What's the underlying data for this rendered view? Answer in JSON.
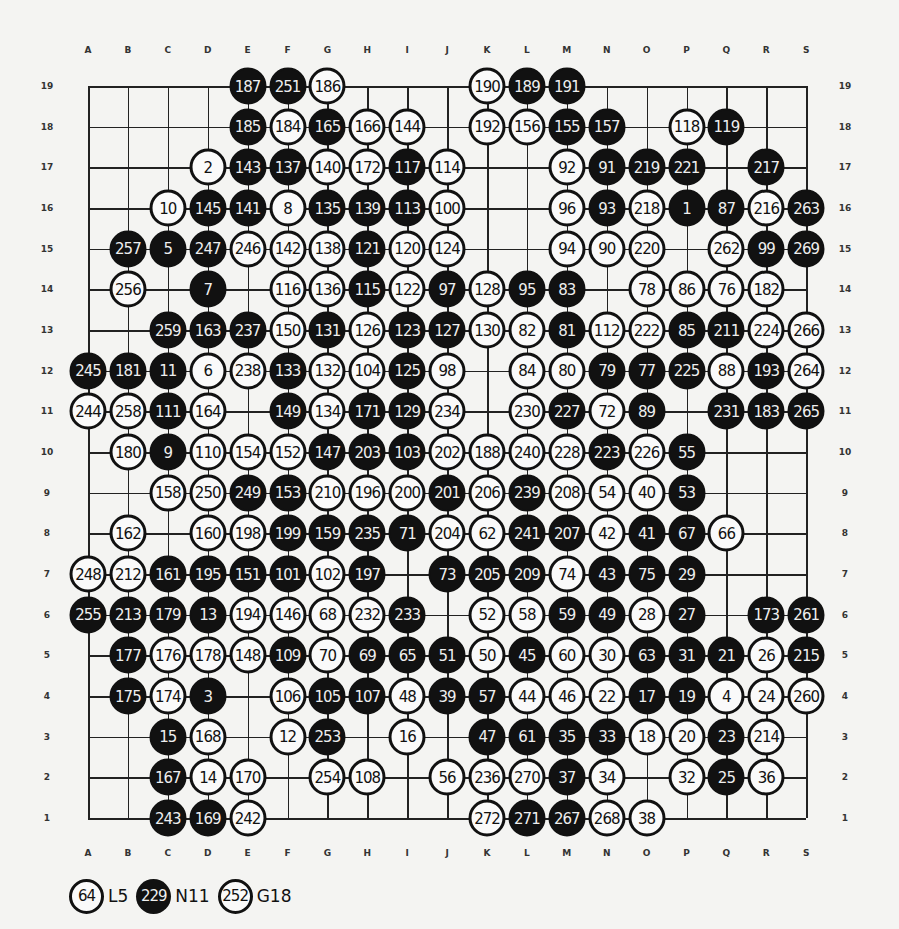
{
  "board": {
    "columns": [
      "A",
      "B",
      "C",
      "D",
      "E",
      "F",
      "G",
      "H",
      "I",
      "J",
      "K",
      "L",
      "M",
      "N",
      "O",
      "P",
      "Q",
      "R",
      "S"
    ],
    "rows": [
      19,
      18,
      17,
      16,
      15,
      14,
      13,
      12,
      11,
      10,
      9,
      8,
      7,
      6,
      5,
      4,
      3,
      2,
      1
    ],
    "colors": {
      "black": "#111111",
      "white": "#fafafa",
      "line": "#222222",
      "background": "#f4f4f2"
    }
  },
  "stones": [
    [
      "E",
      19,
      "187",
      "b"
    ],
    [
      "F",
      19,
      "251",
      "b"
    ],
    [
      "G",
      19,
      "186",
      "w"
    ],
    [
      "K",
      19,
      "190",
      "w"
    ],
    [
      "L",
      19,
      "189",
      "b"
    ],
    [
      "M",
      19,
      "191",
      "b"
    ],
    [
      "E",
      18,
      "185",
      "b"
    ],
    [
      "F",
      18,
      "184",
      "w"
    ],
    [
      "G",
      18,
      "165",
      "b"
    ],
    [
      "H",
      18,
      "166",
      "w"
    ],
    [
      "I",
      18,
      "144",
      "w"
    ],
    [
      "K",
      18,
      "192",
      "w"
    ],
    [
      "L",
      18,
      "156",
      "w"
    ],
    [
      "M",
      18,
      "155",
      "b"
    ],
    [
      "N",
      18,
      "157",
      "b"
    ],
    [
      "P",
      18,
      "118",
      "w"
    ],
    [
      "Q",
      18,
      "119",
      "b"
    ],
    [
      "D",
      17,
      "2",
      "w"
    ],
    [
      "E",
      17,
      "143",
      "b"
    ],
    [
      "F",
      17,
      "137",
      "b"
    ],
    [
      "G",
      17,
      "140",
      "w"
    ],
    [
      "H",
      17,
      "172",
      "w"
    ],
    [
      "I",
      17,
      "117",
      "b"
    ],
    [
      "J",
      17,
      "114",
      "w"
    ],
    [
      "M",
      17,
      "92",
      "w"
    ],
    [
      "N",
      17,
      "91",
      "b"
    ],
    [
      "O",
      17,
      "219",
      "b"
    ],
    [
      "P",
      17,
      "221",
      "b"
    ],
    [
      "R",
      17,
      "217",
      "b"
    ],
    [
      "C",
      16,
      "10",
      "w"
    ],
    [
      "D",
      16,
      "145",
      "b"
    ],
    [
      "E",
      16,
      "141",
      "b"
    ],
    [
      "F",
      16,
      "8",
      "w"
    ],
    [
      "G",
      16,
      "135",
      "b"
    ],
    [
      "H",
      16,
      "139",
      "b"
    ],
    [
      "I",
      16,
      "113",
      "b"
    ],
    [
      "J",
      16,
      "100",
      "w"
    ],
    [
      "M",
      16,
      "96",
      "w"
    ],
    [
      "N",
      16,
      "93",
      "b"
    ],
    [
      "O",
      16,
      "218",
      "w"
    ],
    [
      "P",
      16,
      "1",
      "b"
    ],
    [
      "Q",
      16,
      "87",
      "b"
    ],
    [
      "R",
      16,
      "216",
      "w"
    ],
    [
      "S",
      16,
      "263",
      "b"
    ],
    [
      "B",
      15,
      "257",
      "b"
    ],
    [
      "C",
      15,
      "5",
      "b"
    ],
    [
      "D",
      15,
      "247",
      "b"
    ],
    [
      "E",
      15,
      "246",
      "w"
    ],
    [
      "F",
      15,
      "142",
      "w"
    ],
    [
      "G",
      15,
      "138",
      "w"
    ],
    [
      "H",
      15,
      "121",
      "b"
    ],
    [
      "I",
      15,
      "120",
      "w"
    ],
    [
      "J",
      15,
      "124",
      "w"
    ],
    [
      "M",
      15,
      "94",
      "w"
    ],
    [
      "N",
      15,
      "90",
      "w"
    ],
    [
      "O",
      15,
      "220",
      "w"
    ],
    [
      "Q",
      15,
      "262",
      "w"
    ],
    [
      "R",
      15,
      "99",
      "b"
    ],
    [
      "S",
      15,
      "269",
      "b"
    ],
    [
      "B",
      14,
      "256",
      "w"
    ],
    [
      "D",
      14,
      "7",
      "b"
    ],
    [
      "F",
      14,
      "116",
      "w"
    ],
    [
      "G",
      14,
      "136",
      "w"
    ],
    [
      "H",
      14,
      "115",
      "b"
    ],
    [
      "I",
      14,
      "122",
      "w"
    ],
    [
      "J",
      14,
      "97",
      "b"
    ],
    [
      "K",
      14,
      "128",
      "w"
    ],
    [
      "L",
      14,
      "95",
      "b"
    ],
    [
      "M",
      14,
      "83",
      "b"
    ],
    [
      "O",
      14,
      "78",
      "w"
    ],
    [
      "P",
      14,
      "86",
      "w"
    ],
    [
      "Q",
      14,
      "76",
      "w"
    ],
    [
      "R",
      14,
      "182",
      "w"
    ],
    [
      "C",
      13,
      "259",
      "b"
    ],
    [
      "D",
      13,
      "163",
      "b"
    ],
    [
      "E",
      13,
      "237",
      "b"
    ],
    [
      "F",
      13,
      "150",
      "w"
    ],
    [
      "G",
      13,
      "131",
      "b"
    ],
    [
      "H",
      13,
      "126",
      "w"
    ],
    [
      "I",
      13,
      "123",
      "b"
    ],
    [
      "J",
      13,
      "127",
      "b"
    ],
    [
      "K",
      13,
      "130",
      "w"
    ],
    [
      "L",
      13,
      "82",
      "w"
    ],
    [
      "M",
      13,
      "81",
      "b"
    ],
    [
      "N",
      13,
      "112",
      "w"
    ],
    [
      "O",
      13,
      "222",
      "w"
    ],
    [
      "P",
      13,
      "85",
      "b"
    ],
    [
      "Q",
      13,
      "211",
      "b"
    ],
    [
      "R",
      13,
      "224",
      "w"
    ],
    [
      "S",
      13,
      "266",
      "w"
    ],
    [
      "A",
      12,
      "245",
      "b"
    ],
    [
      "B",
      12,
      "181",
      "b"
    ],
    [
      "C",
      12,
      "11",
      "b"
    ],
    [
      "D",
      12,
      "6",
      "w"
    ],
    [
      "E",
      12,
      "238",
      "w"
    ],
    [
      "F",
      12,
      "133",
      "b"
    ],
    [
      "G",
      12,
      "132",
      "w"
    ],
    [
      "H",
      12,
      "104",
      "w"
    ],
    [
      "I",
      12,
      "125",
      "b"
    ],
    [
      "J",
      12,
      "98",
      "w"
    ],
    [
      "L",
      12,
      "84",
      "w"
    ],
    [
      "M",
      12,
      "80",
      "w"
    ],
    [
      "N",
      12,
      "79",
      "b"
    ],
    [
      "O",
      12,
      "77",
      "b"
    ],
    [
      "P",
      12,
      "225",
      "b"
    ],
    [
      "Q",
      12,
      "88",
      "w"
    ],
    [
      "R",
      12,
      "193",
      "b"
    ],
    [
      "S",
      12,
      "264",
      "w"
    ],
    [
      "A",
      11,
      "244",
      "w"
    ],
    [
      "B",
      11,
      "258",
      "w"
    ],
    [
      "C",
      11,
      "111",
      "b"
    ],
    [
      "D",
      11,
      "164",
      "w"
    ],
    [
      "F",
      11,
      "149",
      "b"
    ],
    [
      "G",
      11,
      "134",
      "w"
    ],
    [
      "H",
      11,
      "171",
      "b"
    ],
    [
      "I",
      11,
      "129",
      "b"
    ],
    [
      "J",
      11,
      "234",
      "w"
    ],
    [
      "L",
      11,
      "230",
      "w"
    ],
    [
      "M",
      11,
      "227",
      "b"
    ],
    [
      "N",
      11,
      "72",
      "w"
    ],
    [
      "O",
      11,
      "89",
      "b"
    ],
    [
      "Q",
      11,
      "231",
      "b"
    ],
    [
      "R",
      11,
      "183",
      "b"
    ],
    [
      "S",
      11,
      "265",
      "b"
    ],
    [
      "B",
      10,
      "180",
      "w"
    ],
    [
      "C",
      10,
      "9",
      "b"
    ],
    [
      "D",
      10,
      "110",
      "w"
    ],
    [
      "E",
      10,
      "154",
      "w"
    ],
    [
      "F",
      10,
      "152",
      "w"
    ],
    [
      "G",
      10,
      "147",
      "b"
    ],
    [
      "H",
      10,
      "203",
      "b"
    ],
    [
      "I",
      10,
      "103",
      "b"
    ],
    [
      "J",
      10,
      "202",
      "w"
    ],
    [
      "K",
      10,
      "188",
      "w"
    ],
    [
      "L",
      10,
      "240",
      "w"
    ],
    [
      "M",
      10,
      "228",
      "w"
    ],
    [
      "N",
      10,
      "223",
      "b"
    ],
    [
      "O",
      10,
      "226",
      "w"
    ],
    [
      "P",
      10,
      "55",
      "b"
    ],
    [
      "C",
      9,
      "158",
      "w"
    ],
    [
      "D",
      9,
      "250",
      "w"
    ],
    [
      "E",
      9,
      "249",
      "b"
    ],
    [
      "F",
      9,
      "153",
      "b"
    ],
    [
      "G",
      9,
      "210",
      "w"
    ],
    [
      "H",
      9,
      "196",
      "w"
    ],
    [
      "I",
      9,
      "200",
      "w"
    ],
    [
      "J",
      9,
      "201",
      "b"
    ],
    [
      "K",
      9,
      "206",
      "w"
    ],
    [
      "L",
      9,
      "239",
      "b"
    ],
    [
      "M",
      9,
      "208",
      "w"
    ],
    [
      "N",
      9,
      "54",
      "w"
    ],
    [
      "O",
      9,
      "40",
      "w"
    ],
    [
      "P",
      9,
      "53",
      "b"
    ],
    [
      "B",
      8,
      "162",
      "w"
    ],
    [
      "D",
      8,
      "160",
      "w"
    ],
    [
      "E",
      8,
      "198",
      "w"
    ],
    [
      "F",
      8,
      "199",
      "b"
    ],
    [
      "G",
      8,
      "159",
      "b"
    ],
    [
      "H",
      8,
      "235",
      "b"
    ],
    [
      "I",
      8,
      "71",
      "b"
    ],
    [
      "J",
      8,
      "204",
      "w"
    ],
    [
      "K",
      8,
      "62",
      "w"
    ],
    [
      "L",
      8,
      "241",
      "b"
    ],
    [
      "M",
      8,
      "207",
      "b"
    ],
    [
      "N",
      8,
      "42",
      "w"
    ],
    [
      "O",
      8,
      "41",
      "b"
    ],
    [
      "P",
      8,
      "67",
      "b"
    ],
    [
      "Q",
      8,
      "66",
      "w"
    ],
    [
      "A",
      7,
      "248",
      "w"
    ],
    [
      "B",
      7,
      "212",
      "w"
    ],
    [
      "C",
      7,
      "161",
      "b"
    ],
    [
      "D",
      7,
      "195",
      "b"
    ],
    [
      "E",
      7,
      "151",
      "b"
    ],
    [
      "F",
      7,
      "101",
      "b"
    ],
    [
      "G",
      7,
      "102",
      "w"
    ],
    [
      "H",
      7,
      "197",
      "b"
    ],
    [
      "J",
      7,
      "73",
      "b"
    ],
    [
      "K",
      7,
      "205",
      "b"
    ],
    [
      "L",
      7,
      "209",
      "b"
    ],
    [
      "M",
      7,
      "74",
      "w"
    ],
    [
      "N",
      7,
      "43",
      "b"
    ],
    [
      "O",
      7,
      "75",
      "b"
    ],
    [
      "P",
      7,
      "29",
      "b"
    ],
    [
      "A",
      6,
      "255",
      "b"
    ],
    [
      "B",
      6,
      "213",
      "b"
    ],
    [
      "C",
      6,
      "179",
      "b"
    ],
    [
      "D",
      6,
      "13",
      "b"
    ],
    [
      "E",
      6,
      "194",
      "w"
    ],
    [
      "F",
      6,
      "146",
      "w"
    ],
    [
      "G",
      6,
      "68",
      "w"
    ],
    [
      "H",
      6,
      "232",
      "w"
    ],
    [
      "I",
      6,
      "233",
      "b"
    ],
    [
      "K",
      6,
      "52",
      "w"
    ],
    [
      "L",
      6,
      "58",
      "w"
    ],
    [
      "M",
      6,
      "59",
      "b"
    ],
    [
      "N",
      6,
      "49",
      "b"
    ],
    [
      "O",
      6,
      "28",
      "w"
    ],
    [
      "P",
      6,
      "27",
      "b"
    ],
    [
      "R",
      6,
      "173",
      "b"
    ],
    [
      "S",
      6,
      "261",
      "b"
    ],
    [
      "B",
      5,
      "177",
      "b"
    ],
    [
      "C",
      5,
      "176",
      "w"
    ],
    [
      "D",
      5,
      "178",
      "w"
    ],
    [
      "E",
      5,
      "148",
      "w"
    ],
    [
      "F",
      5,
      "109",
      "b"
    ],
    [
      "G",
      5,
      "70",
      "w"
    ],
    [
      "H",
      5,
      "69",
      "b"
    ],
    [
      "I",
      5,
      "65",
      "b"
    ],
    [
      "J",
      5,
      "51",
      "b"
    ],
    [
      "K",
      5,
      "50",
      "w"
    ],
    [
      "L",
      5,
      "45",
      "b"
    ],
    [
      "M",
      5,
      "60",
      "w"
    ],
    [
      "N",
      5,
      "30",
      "w"
    ],
    [
      "O",
      5,
      "63",
      "b"
    ],
    [
      "P",
      5,
      "31",
      "b"
    ],
    [
      "Q",
      5,
      "21",
      "b"
    ],
    [
      "R",
      5,
      "26",
      "w"
    ],
    [
      "S",
      5,
      "215",
      "b"
    ],
    [
      "B",
      4,
      "175",
      "b"
    ],
    [
      "C",
      4,
      "174",
      "w"
    ],
    [
      "D",
      4,
      "3",
      "b"
    ],
    [
      "F",
      4,
      "106",
      "w"
    ],
    [
      "G",
      4,
      "105",
      "b"
    ],
    [
      "H",
      4,
      "107",
      "b"
    ],
    [
      "I",
      4,
      "48",
      "w"
    ],
    [
      "J",
      4,
      "39",
      "b"
    ],
    [
      "K",
      4,
      "57",
      "b"
    ],
    [
      "L",
      4,
      "44",
      "w"
    ],
    [
      "M",
      4,
      "46",
      "w"
    ],
    [
      "N",
      4,
      "22",
      "w"
    ],
    [
      "O",
      4,
      "17",
      "b"
    ],
    [
      "P",
      4,
      "19",
      "b"
    ],
    [
      "Q",
      4,
      "4",
      "w"
    ],
    [
      "R",
      4,
      "24",
      "w"
    ],
    [
      "S",
      4,
      "260",
      "w"
    ],
    [
      "C",
      3,
      "15",
      "b"
    ],
    [
      "D",
      3,
      "168",
      "w"
    ],
    [
      "F",
      3,
      "12",
      "w"
    ],
    [
      "G",
      3,
      "253",
      "b"
    ],
    [
      "I",
      3,
      "16",
      "w"
    ],
    [
      "K",
      3,
      "47",
      "b"
    ],
    [
      "L",
      3,
      "61",
      "b"
    ],
    [
      "M",
      3,
      "35",
      "b"
    ],
    [
      "N",
      3,
      "33",
      "b"
    ],
    [
      "O",
      3,
      "18",
      "w"
    ],
    [
      "P",
      3,
      "20",
      "w"
    ],
    [
      "Q",
      3,
      "23",
      "b"
    ],
    [
      "R",
      3,
      "214",
      "w"
    ],
    [
      "C",
      2,
      "167",
      "b"
    ],
    [
      "D",
      2,
      "14",
      "w"
    ],
    [
      "E",
      2,
      "170",
      "w"
    ],
    [
      "G",
      2,
      "254",
      "w"
    ],
    [
      "H",
      2,
      "108",
      "w"
    ],
    [
      "J",
      2,
      "56",
      "w"
    ],
    [
      "K",
      2,
      "236",
      "w"
    ],
    [
      "L",
      2,
      "270",
      "w"
    ],
    [
      "M",
      2,
      "37",
      "b"
    ],
    [
      "N",
      2,
      "34",
      "w"
    ],
    [
      "P",
      2,
      "32",
      "w"
    ],
    [
      "Q",
      2,
      "25",
      "b"
    ],
    [
      "R",
      2,
      "36",
      "w"
    ],
    [
      "C",
      1,
      "243",
      "b"
    ],
    [
      "D",
      1,
      "169",
      "b"
    ],
    [
      "E",
      1,
      "242",
      "w"
    ],
    [
      "K",
      1,
      "272",
      "w"
    ],
    [
      "L",
      1,
      "271",
      "b"
    ],
    [
      "M",
      1,
      "267",
      "b"
    ],
    [
      "N",
      1,
      "268",
      "w"
    ],
    [
      "O",
      1,
      "38",
      "w"
    ]
  ],
  "legend": [
    {
      "number": "64",
      "color": "w",
      "point": "L5"
    },
    {
      "number": "229",
      "color": "b",
      "point": "N11"
    },
    {
      "number": "252",
      "color": "w",
      "point": "G18"
    }
  ]
}
